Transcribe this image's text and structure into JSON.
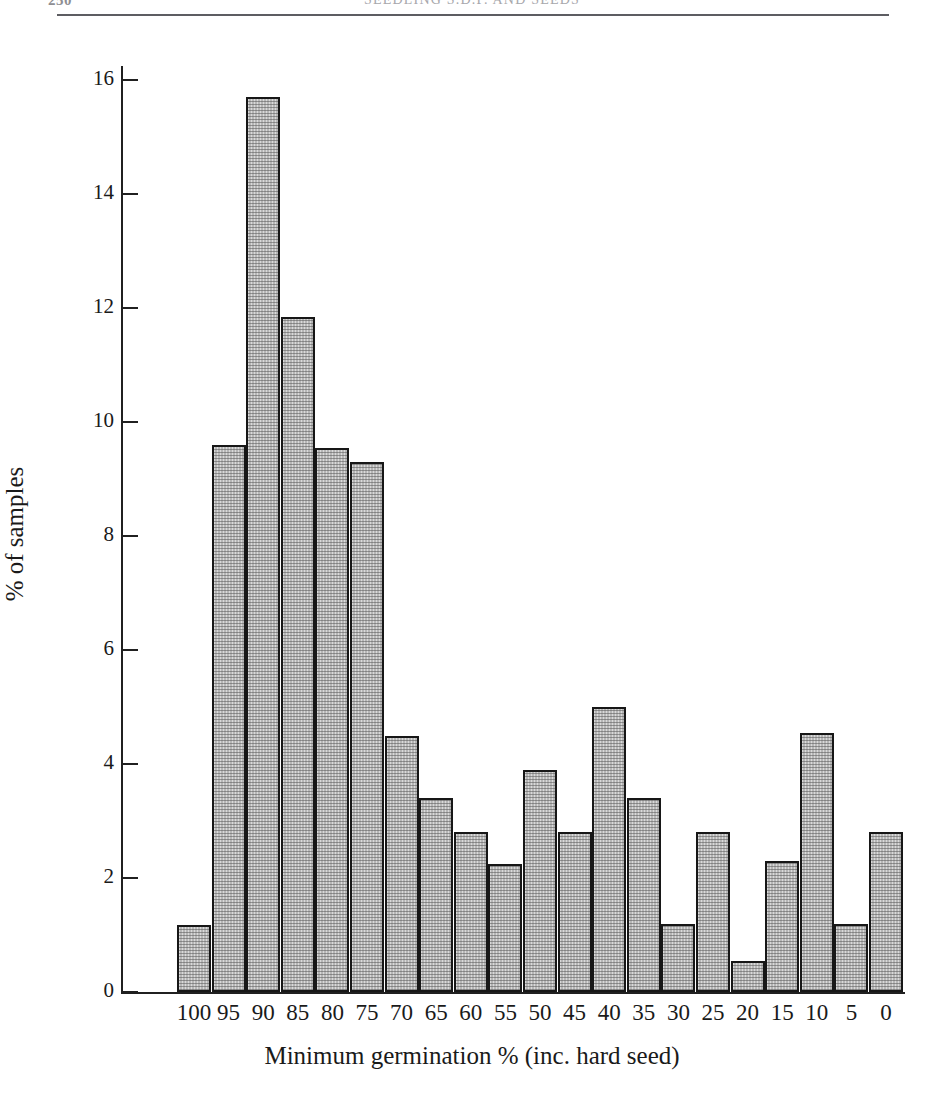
{
  "header": {
    "page_number": "250",
    "running_title": "SEEDLING S.D.P. AND SEEDS"
  },
  "chart_data": {
    "type": "bar",
    "title": "",
    "xlabel": "Minimum germination % (inc. hard seed)",
    "ylabel": "% of samples",
    "categories": [
      "100",
      "95",
      "90",
      "85",
      "80",
      "75",
      "70",
      "65",
      "60",
      "55",
      "50",
      "45",
      "40",
      "35",
      "30",
      "25",
      "20",
      "15",
      "10",
      "5",
      "0"
    ],
    "values": [
      1.18,
      9.6,
      15.7,
      11.85,
      9.55,
      9.3,
      4.5,
      3.4,
      2.8,
      2.25,
      3.9,
      2.8,
      5.0,
      3.4,
      1.2,
      2.8,
      0.55,
      2.3,
      4.55,
      1.2,
      2.8
    ],
    "ylim": [
      0,
      16
    ],
    "ytick_values": [
      0,
      2,
      4,
      6,
      8,
      10,
      12,
      14,
      16
    ],
    "ytick_labels": [
      "0",
      "2",
      "4",
      "6",
      "8",
      "10",
      "12",
      "14",
      "16"
    ],
    "grid": false,
    "legend": "none",
    "bar_fill_color": "#d9d9d9",
    "bar_border_color": "#171717",
    "axis_color": "#202020"
  }
}
